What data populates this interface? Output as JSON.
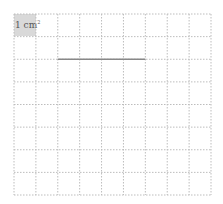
{
  "diagram": {
    "type": "grid",
    "columns": 9,
    "rows": 8,
    "cell_unit": "1 cm",
    "unit_label": {
      "text": "1 cm",
      "superscript": "2"
    },
    "segment": {
      "start_col": 2,
      "end_col": 6,
      "row_line": 2,
      "length_cells": 4,
      "color": "#888888"
    },
    "colors": {
      "grid_line": "#bdbdbd",
      "unit_cell_fill": "#d9d9d9",
      "background": "#ffffff"
    }
  }
}
